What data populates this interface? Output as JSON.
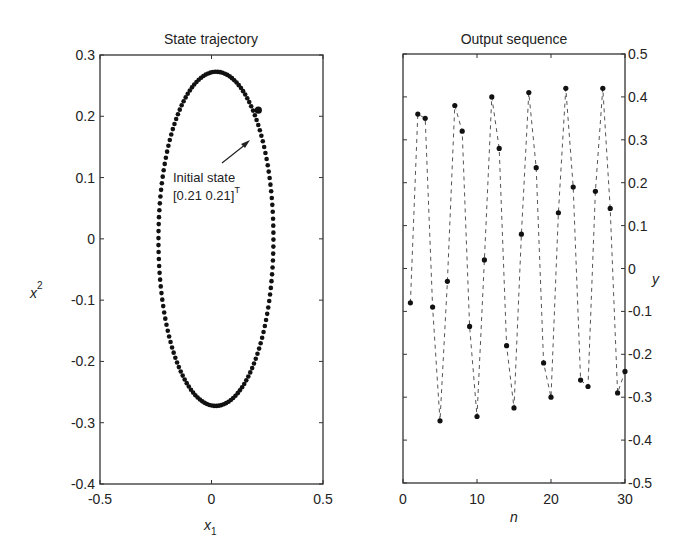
{
  "chart_data": [
    {
      "type": "scatter",
      "title": "State trajectory",
      "xlabel": "x_1",
      "ylabel": "x^2",
      "xlim": [
        -0.5,
        0.5
      ],
      "ylim": [
        -0.4,
        0.3
      ],
      "xticks": [
        "-0.5",
        "0",
        "0.5"
      ],
      "yticks": [
        "0.3",
        "0.2",
        "0.1",
        "0",
        "-0.1",
        "-0.2",
        "-0.3",
        "-0.4"
      ],
      "grid": false,
      "description": "Closed elliptical orbit of densely plotted dots, tilted slightly; top at about (0.05, 0.275), bottom at about (0.03, -0.27), leftmost about -0.25, rightmost about 0.27",
      "ellipse": {
        "center": [
          0.02,
          0.0
        ],
        "x_radius": 0.26,
        "y_radius": 0.275,
        "tilt_deg": -8
      },
      "initial_point": [
        0.21,
        0.21
      ],
      "annotation": {
        "line1": "Initial state",
        "line2": "[0.21 0.21]",
        "superscript": "T"
      }
    },
    {
      "type": "line",
      "title": "Output sequence",
      "xlabel": "n",
      "ylabel": "y",
      "xlim": [
        0,
        30
      ],
      "ylim": [
        -0.5,
        0.5
      ],
      "xticks": [
        "0",
        "10",
        "20",
        "30"
      ],
      "yticks": [
        "0.5",
        "0.4",
        "0.3",
        "0.2",
        "0.1",
        "0",
        "-0.1",
        "-0.2",
        "-0.3",
        "-0.4",
        "-0.5"
      ],
      "y_axis_position": "right",
      "grid": false,
      "line_style": "dashed with dot markers",
      "x": [
        1,
        2,
        3,
        4,
        5,
        6,
        7,
        8,
        9,
        10,
        11,
        12,
        13,
        14,
        15,
        16,
        17,
        18,
        19,
        20,
        21,
        22,
        23,
        24,
        25,
        26,
        27,
        28,
        29,
        30
      ],
      "values": [
        -0.08,
        0.36,
        0.35,
        -0.09,
        -0.355,
        -0.03,
        0.38,
        0.32,
        -0.135,
        -0.345,
        0.02,
        0.4,
        0.28,
        -0.18,
        -0.325,
        0.08,
        0.41,
        0.235,
        -0.22,
        -0.3,
        0.13,
        0.42,
        0.19,
        -0.26,
        -0.275,
        0.18,
        0.42,
        0.14,
        -0.29,
        -0.24
      ]
    }
  ]
}
